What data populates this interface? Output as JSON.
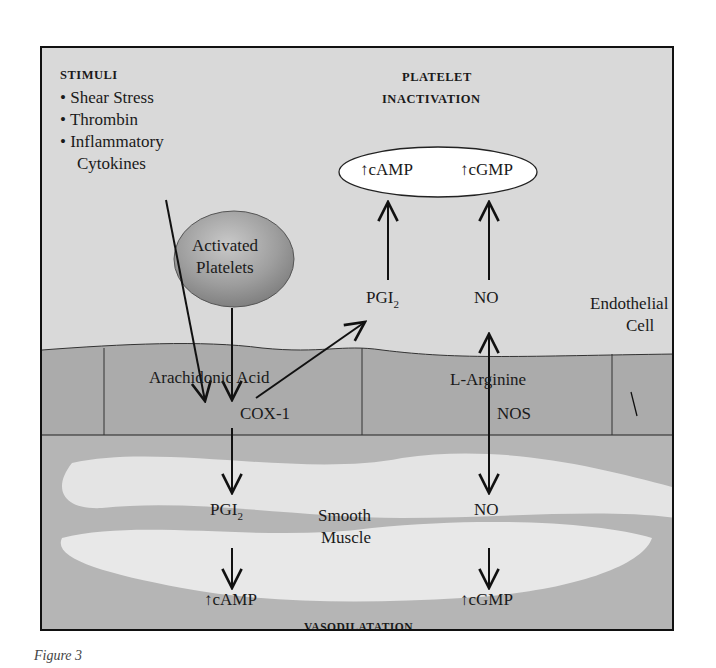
{
  "figure": {
    "caption": "Figure 3",
    "colors": {
      "background_top": "#d7d7d7",
      "endothelium": "#a9a9a9",
      "smooth_muscle_base": "#b8b8b8",
      "smooth_muscle_highlight": "#e6e6e6",
      "platelet_sphere": "#9d9d9d",
      "ellipse_fill": "#ffffff",
      "line": "#111111"
    }
  },
  "stimuli": {
    "heading": "STIMULI",
    "items": [
      "Shear Stress",
      "Thrombin",
      "Inflammatory",
      "Cytokines"
    ]
  },
  "platelet_inactivation": {
    "heading_line1": "PLATELET",
    "heading_line2": "INACTIVATION",
    "ellipse_left": "↑cAMP",
    "ellipse_right": "↑cGMP"
  },
  "activated_platelets": {
    "line1": "Activated",
    "line2": "Platelets"
  },
  "upper_pathway": {
    "pgi2_base": "PGI",
    "pgi2_sub": "2",
    "no": "NO"
  },
  "endothelial_cell": {
    "label_line1": "Endothelial",
    "label_line2": "Cell",
    "arachidonic_acid": "Arachidonic Acid",
    "cox1": "COX-1",
    "l_arginine": "L-Arginine",
    "nos": "NOS"
  },
  "smooth_muscle": {
    "label_line1": "Smooth",
    "label_line2": "Muscle",
    "pgi2_base": "PGI",
    "pgi2_sub": "2",
    "no": "NO",
    "camp": "↑cAMP",
    "cgmp": "↑cGMP",
    "result": "VASODILATATION"
  }
}
